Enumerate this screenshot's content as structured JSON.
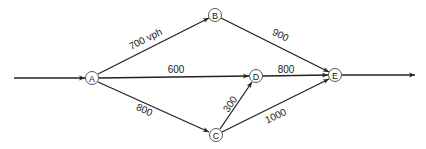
{
  "diagram": {
    "type": "traffic-network",
    "nodes": [
      {
        "id": "A",
        "label": "A",
        "x": 92,
        "y": 78
      },
      {
        "id": "B",
        "label": "B",
        "x": 215,
        "y": 15
      },
      {
        "id": "C",
        "label": "C",
        "x": 216,
        "y": 135
      },
      {
        "id": "D",
        "label": "D",
        "x": 256,
        "y": 76
      },
      {
        "id": "E",
        "label": "E",
        "x": 335,
        "y": 75
      }
    ],
    "edges": [
      {
        "from": "IN",
        "to": "A",
        "label": ""
      },
      {
        "from": "A",
        "to": "B",
        "label": "700 vph"
      },
      {
        "from": "A",
        "to": "D",
        "label": "600"
      },
      {
        "from": "A",
        "to": "C",
        "label": "800"
      },
      {
        "from": "B",
        "to": "E",
        "label": "900"
      },
      {
        "from": "D",
        "to": "E",
        "label": "800"
      },
      {
        "from": "C",
        "to": "D",
        "label": "300"
      },
      {
        "from": "C",
        "to": "E",
        "label": "1000"
      },
      {
        "from": "E",
        "to": "OUT",
        "label": ""
      }
    ],
    "labels": {
      "A": "A",
      "B": "B",
      "C": "C",
      "D": "D",
      "E": "E",
      "AB": "700 vph",
      "AD": "600",
      "AC": "800",
      "BE": "900",
      "DE": "800",
      "CD": "300",
      "CE": "1000"
    }
  }
}
